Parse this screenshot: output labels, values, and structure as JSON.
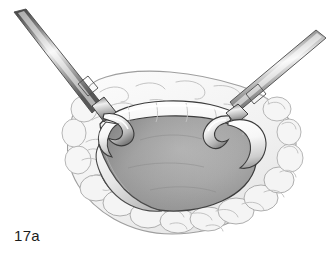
{
  "figure": {
    "label": "17a",
    "caption_text": "17a",
    "background_color": "#ffffff",
    "width": 330,
    "height": 262,
    "medium": "grayscale medical line-and-wash illustration"
  },
  "palette": {
    "background": "#ffffff",
    "outline": "#3a3a3a",
    "outline_soft": "#8a8a8a",
    "fat_tissue_fill": "#f2f2f2",
    "fat_tissue_shade": "#e2e2e2",
    "fat_texture_stroke": "#b9b9b9",
    "cavity_light": "#b6b6b6",
    "cavity_mid": "#a3a3a3",
    "cavity_dark": "#7e7e7e",
    "cavity_deep": "#6a6a6a",
    "flap_highlight": "#ffffff",
    "flap_shade": "#c9c9c9",
    "metal_dark": "#4e4e4e",
    "metal_mid": "#9a9a9a",
    "metal_light": "#ededed",
    "label_color": "#1c1c1c"
  },
  "scene": {
    "elements": [
      {
        "id": "left-instrument",
        "name": "left-retractor-instrument",
        "description": "straight metallic shaft entering from upper-left corner, angled down-right, ending in a collar then a curved hook tip",
        "shaft_angle_deg": 37,
        "tip_position": [
          104,
          124
        ]
      },
      {
        "id": "right-instrument",
        "name": "right-retractor-instrument",
        "description": "straight metallic shaft entering from upper-right corner, angled down-left, ending in a collar then a curved hook tip",
        "shaft_angle_deg": -39,
        "tip_position": [
          226,
          126
        ]
      },
      {
        "id": "fat-tissue",
        "name": "surrounding-fatty-tissue",
        "description": "pale lobulated adipose tissue ring surrounding the opening, drawn with thin squiggly contour texture and scalloped bottom border"
      },
      {
        "id": "tissue-flap",
        "name": "upper-tissue-flap",
        "description": "raised white tissue ridge along the superior margin of the opening, held by both hooks"
      },
      {
        "id": "cavity",
        "name": "exposed-cavity",
        "description": "central gray cavity interior with graded shading, darkest at lower-left margin"
      },
      {
        "id": "lower-flap",
        "name": "lower-tissue-margin",
        "description": "pale inner wall band along the lower-left of the cavity"
      }
    ]
  }
}
